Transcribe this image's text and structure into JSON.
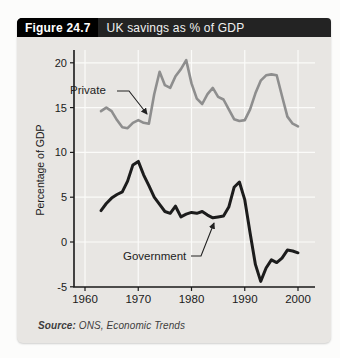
{
  "header": {
    "figure_label": "Figure 24.7",
    "title": "UK savings as % of GDP"
  },
  "source": {
    "label": "Source:",
    "agency": " ONS, ",
    "publication": "Economic Trends"
  },
  "colors": {
    "header_label_bg": "#000000",
    "header_bar_bg": "#232323",
    "header_text": "#ffffff",
    "card_bg": "#e8e6e3",
    "grid_line": "#fbfbf9",
    "axis": "#1a1a1a",
    "private_line": "#8e8e8e",
    "government_line": "#1c1c1c"
  },
  "chart_data": {
    "type": "line",
    "title": "UK savings as % of GDP",
    "xlabel": "",
    "ylabel": "Percentage of GDP",
    "xlim": [
      1960,
      2003
    ],
    "ylim": [
      -5,
      22
    ],
    "x_ticks": [
      1960,
      1970,
      1980,
      1990,
      2000
    ],
    "y_ticks": [
      20,
      15,
      10,
      5,
      0,
      -5
    ],
    "grid": true,
    "legend_position": "inline-annotations",
    "annotations": {
      "private": "Private",
      "government": "Government"
    },
    "x": [
      1963,
      1964,
      1965,
      1966,
      1967,
      1968,
      1969,
      1970,
      1971,
      1972,
      1973,
      1974,
      1975,
      1976,
      1977,
      1978,
      1979,
      1980,
      1981,
      1982,
      1983,
      1984,
      1985,
      1986,
      1987,
      1988,
      1989,
      1990,
      1991,
      1992,
      1993,
      1994,
      1995,
      1996,
      1997,
      1998,
      1999,
      2000
    ],
    "series": [
      {
        "name": "Private",
        "color": "#8e8e8e",
        "values": [
          14.6,
          15.0,
          14.6,
          13.6,
          12.8,
          12.7,
          13.3,
          13.6,
          13.3,
          13.2,
          16.5,
          19.0,
          17.5,
          17.2,
          18.5,
          19.3,
          20.3,
          17.7,
          16.0,
          15.4,
          16.5,
          17.2,
          16.2,
          15.9,
          14.8,
          13.7,
          13.5,
          13.6,
          14.8,
          16.6,
          18.0,
          18.6,
          18.7,
          18.6,
          16.3,
          14.0,
          13.2,
          12.9
        ]
      },
      {
        "name": "Government",
        "color": "#1c1c1c",
        "values": [
          3.5,
          4.3,
          4.9,
          5.3,
          5.6,
          6.8,
          8.6,
          9.0,
          7.5,
          6.3,
          5.0,
          4.2,
          3.4,
          3.2,
          4.0,
          2.8,
          3.1,
          3.3,
          3.2,
          3.4,
          3.0,
          2.7,
          2.8,
          2.9,
          3.9,
          6.1,
          6.7,
          4.7,
          1.0,
          -2.5,
          -4.4,
          -2.9,
          -2.0,
          -2.3,
          -1.8,
          -0.9,
          -1.0,
          -1.2
        ]
      }
    ]
  }
}
